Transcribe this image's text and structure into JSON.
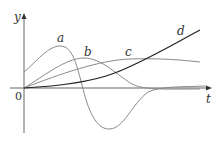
{
  "figure": {
    "axes": {
      "x_label": "t",
      "y_label": "y",
      "origin_label": "0"
    },
    "curves": [
      {
        "id": "a",
        "label": "a",
        "color": "#8a8a8a"
      },
      {
        "id": "b",
        "label": "b",
        "color": "#8a8a8a"
      },
      {
        "id": "c",
        "label": "c",
        "color": "#8a8a8a"
      },
      {
        "id": "d",
        "label": "d",
        "color": "#222222"
      }
    ]
  }
}
